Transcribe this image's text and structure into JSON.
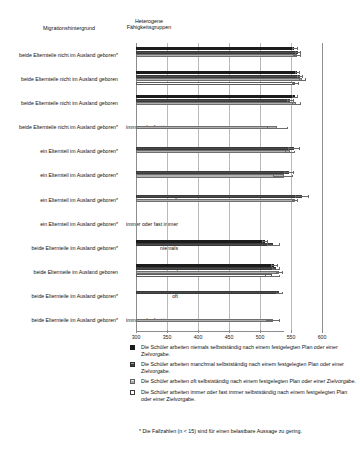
{
  "headers": {
    "migration": "Migrationshintergrund",
    "heterogene": "Heterogene Fähigkeitsgruppen"
  },
  "legend": [
    {
      "swatch": "solid-black-swatch",
      "text": "Die Schüler arbeiten niemals selbstständig nach einem festgelegten Plan oder einer Zielvorgabe."
    },
    {
      "swatch": "dark-hatched-swatch",
      "text": "Die Schüler arbeiten manchmal selbstständig nach einem festgelegten Plan oder einer Zielvorgabe."
    },
    {
      "swatch": "light-hatched-swatch",
      "text": "Die Schüler arbeiten oft selbstständig nach einem festgelegten Plan oder einer Zielvorgabe."
    },
    {
      "swatch": "white-swatch",
      "text": "Die Schüler arbeiten immer oder fast immer selbstständig nach einem festgelegten Plan oder einer Zielvorgabe."
    }
  ],
  "footnote": "* Die Fallzahlen (n < 15) sind für einen belastbare Aussage zu gering.",
  "chart_data": {
    "type": "bar",
    "orientation": "horizontal",
    "title": "",
    "xlabel": "",
    "ylabel": "",
    "xlim": [
      300,
      600
    ],
    "xticks": [
      300,
      350,
      400,
      450,
      500,
      550,
      600
    ],
    "xtick_labels": [
      "300",
      "350",
      "400",
      "450",
      "500",
      "550",
      "600"
    ],
    "grid": true,
    "legend_position": "bottom",
    "series_names": [
      "Die Schüler arbeiten niemals selbstständig nach einem festgelegten Plan oder einer Zielvorgabe.",
      "Die Schüler arbeiten manchmal selbstständig nach einem festgelegten Plan oder einer Zielvorgabe.",
      "Die Schüler arbeiten oft selbstständig nach einem festgelegten Plan oder einer Zielvorgabe.",
      "Die Schüler arbeiten immer oder fast immer selbstständig nach einem festgelegten Plan oder einer Zielvorgabe."
    ],
    "rows": [
      {
        "migration": "beide Elternteile nicht im Ausland geboren*",
        "heterogene": "niemals",
        "bars": [
          {
            "series": 0,
            "value": 555,
            "err_low": 551,
            "err_high": 560
          },
          {
            "series": 1,
            "value": 561,
            "err_low": 556,
            "err_high": 566
          },
          {
            "series": 2,
            "value": 559,
            "err_low": 553,
            "err_high": 566
          },
          {
            "series": 3,
            "value": null,
            "err_low": null,
            "err_high": null
          }
        ]
      },
      {
        "migration": "beide Elternteile nicht im Ausland geboren",
        "heterogene": "manchmal",
        "bars": [
          {
            "series": 0,
            "value": 560,
            "err_low": 556,
            "err_high": 564
          },
          {
            "series": 1,
            "value": 564,
            "err_low": 560,
            "err_high": 568
          },
          {
            "series": 2,
            "value": 568,
            "err_low": 563,
            "err_high": 573
          },
          {
            "series": 3,
            "value": 557,
            "err_low": 552,
            "err_high": 562
          }
        ]
      },
      {
        "migration": "beide Elternteile nicht im Ausland geboren",
        "heterogene": "oft",
        "bars": [
          {
            "series": 0,
            "value": 556,
            "err_low": 551,
            "err_high": 561
          },
          {
            "series": 1,
            "value": 549,
            "err_low": 544,
            "err_high": 554
          },
          {
            "series": 2,
            "value": 558,
            "err_low": 552,
            "err_high": 565
          },
          {
            "series": 3,
            "value": null,
            "err_low": null,
            "err_high": null
          }
        ]
      },
      {
        "migration": "beide Elternteile nicht im Ausland geboren*",
        "heterogene": "immer oder fast immer",
        "bars": [
          {
            "series": 0,
            "value": null,
            "err_low": null,
            "err_high": null
          },
          {
            "series": 1,
            "value": null,
            "err_low": null,
            "err_high": null
          },
          {
            "series": 2,
            "value": 528,
            "err_low": 511,
            "err_high": 545
          },
          {
            "series": 3,
            "value": null,
            "err_low": null,
            "err_high": null
          }
        ]
      },
      {
        "migration": "ein Elternteil im Ausland geboren*",
        "heterogene": "niemals",
        "bars": [
          {
            "series": 0,
            "value": null,
            "err_low": null,
            "err_high": null
          },
          {
            "series": 1,
            "value": 555,
            "err_low": 545,
            "err_high": 564
          },
          {
            "series": 2,
            "value": 548,
            "err_low": 540,
            "err_high": 556
          },
          {
            "series": 3,
            "value": null,
            "err_low": null,
            "err_high": null
          }
        ]
      },
      {
        "migration": "ein Elternteil im Ausland geboren*",
        "heterogene": "manchmal",
        "bars": [
          {
            "series": 0,
            "value": null,
            "err_low": null,
            "err_high": null
          },
          {
            "series": 1,
            "value": 546,
            "err_low": 538,
            "err_high": 555
          },
          {
            "series": 2,
            "value": 539,
            "err_low": 521,
            "err_high": 552
          },
          {
            "series": 3,
            "value": null,
            "err_low": null,
            "err_high": null
          }
        ]
      },
      {
        "migration": "ein Elternteil im Ausland geboren*",
        "heterogene": "oft",
        "bars": [
          {
            "series": 0,
            "value": null,
            "err_low": null,
            "err_high": null
          },
          {
            "series": 1,
            "value": 567,
            "err_low": 557,
            "err_high": 578
          },
          {
            "series": 2,
            "value": 556,
            "err_low": 551,
            "err_high": 561
          },
          {
            "series": 3,
            "value": null,
            "err_low": null,
            "err_high": null
          }
        ]
      },
      {
        "migration": "ein Elternteil im Ausland geboren*",
        "heterogene": "immer oder fast immer",
        "bars": [
          {
            "series": 0,
            "value": null,
            "err_low": null,
            "err_high": null
          },
          {
            "series": 1,
            "value": null,
            "err_low": null,
            "err_high": null
          },
          {
            "series": 2,
            "value": null,
            "err_low": null,
            "err_high": null
          },
          {
            "series": 3,
            "value": null,
            "err_low": null,
            "err_high": null
          }
        ]
      },
      {
        "migration": "beide Elternteile im Ausland geboren*",
        "heterogene": "niemals",
        "bars": [
          {
            "series": 0,
            "value": 508,
            "err_low": 504,
            "err_high": 513
          },
          {
            "series": 1,
            "value": 521,
            "err_low": 512,
            "err_high": 532
          },
          {
            "series": 2,
            "value": null,
            "err_low": null,
            "err_high": null
          },
          {
            "series": 3,
            "value": null,
            "err_low": null,
            "err_high": null
          }
        ]
      },
      {
        "migration": "beide Elternteile im Ausland geboren",
        "heterogene": "manchmal",
        "bars": [
          {
            "series": 0,
            "value": 522,
            "err_low": 517,
            "err_high": 528
          },
          {
            "series": 1,
            "value": 526,
            "err_low": 520,
            "err_high": 532
          },
          {
            "series": 2,
            "value": 531,
            "err_low": 525,
            "err_high": 537
          },
          {
            "series": 3,
            "value": 520,
            "err_low": 508,
            "err_high": 531
          }
        ]
      },
      {
        "migration": "beide Elternteile im Ausland geboren*",
        "heterogene": "oft",
        "bars": [
          {
            "series": 0,
            "value": null,
            "err_low": null,
            "err_high": null
          },
          {
            "series": 1,
            "value": 531,
            "err_low": 525,
            "err_high": 537
          },
          {
            "series": 2,
            "value": null,
            "err_low": null,
            "err_high": null
          },
          {
            "series": 3,
            "value": null,
            "err_low": null,
            "err_high": null
          }
        ]
      },
      {
        "migration": "beide Elternteile im Ausland geboren*",
        "heterogene": "immer oder fast immer",
        "bars": [
          {
            "series": 0,
            "value": null,
            "err_low": null,
            "err_high": null
          },
          {
            "series": 1,
            "value": null,
            "err_low": null,
            "err_high": null
          },
          {
            "series": 2,
            "value": 521,
            "err_low": 510,
            "err_high": 531
          },
          {
            "series": 3,
            "value": null,
            "err_low": null,
            "err_high": null
          }
        ]
      }
    ]
  }
}
